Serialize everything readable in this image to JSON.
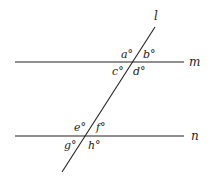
{
  "diagram": {
    "type": "parallel-lines-transversal",
    "colors": {
      "line": "#222222",
      "background": "#ffffff"
    },
    "lines": {
      "transversal": {
        "label": "l",
        "x1": 155,
        "y1": 27,
        "x2": 62,
        "y2": 172,
        "label_x": 154,
        "label_y": 20
      },
      "m": {
        "label": "m",
        "x1": 15,
        "y1": 62,
        "x2": 184,
        "y2": 62,
        "label_x": 189,
        "label_y": 66
      },
      "n": {
        "label": "n",
        "x1": 15,
        "y1": 136,
        "x2": 184,
        "y2": 136,
        "label_x": 191,
        "label_y": 140
      }
    },
    "angles": [
      {
        "label": "a°",
        "x": 121,
        "y": 58
      },
      {
        "label": "b°",
        "x": 143,
        "y": 58
      },
      {
        "label": "c°",
        "x": 112,
        "y": 75
      },
      {
        "label": "d°",
        "x": 133,
        "y": 75
      },
      {
        "label": "e°",
        "x": 74,
        "y": 131
      },
      {
        "label": "f°",
        "x": 96,
        "y": 131
      },
      {
        "label": "g°",
        "x": 64,
        "y": 149
      },
      {
        "label": "h°",
        "x": 88,
        "y": 149
      }
    ]
  }
}
